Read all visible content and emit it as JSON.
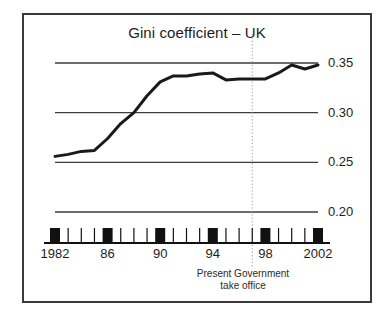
{
  "figure": {
    "title": "Gini coefficient – UK",
    "background_color": "#ffffff",
    "border_color": "#3a3a3a",
    "line_color": "#1a1a1a",
    "gridline_color": "#3d3d3d",
    "marker_color": "#111111",
    "annotation_line_color": "#9a9a9a"
  },
  "annotation": {
    "line1": "Present Government",
    "line2": "take office",
    "at_year": 1997
  },
  "chart_data": {
    "type": "line",
    "title": "Gini coefficient – UK",
    "xlabel": "",
    "ylabel": "",
    "xlim": [
      1982,
      2002
    ],
    "ylim": [
      0.2,
      0.355
    ],
    "grid": true,
    "gridlines_y": [
      0.2,
      0.25,
      0.3,
      0.35
    ],
    "legend": "none",
    "ytick_labels": [
      "0.35",
      "0.30",
      "0.25",
      "0.20"
    ],
    "ytick_values": [
      0.35,
      0.3,
      0.25,
      0.2
    ],
    "xtick_labels": [
      "1982",
      "86",
      "90",
      "94",
      "98",
      "2002"
    ],
    "xtick_values": [
      1982,
      1986,
      1990,
      1994,
      1998,
      2002
    ],
    "minor_xticks": [
      1983,
      1984,
      1985,
      1987,
      1988,
      1989,
      1991,
      1992,
      1993,
      1995,
      1996,
      1997,
      1999,
      2000,
      2001
    ],
    "x": [
      1982,
      1983,
      1984,
      1985,
      1986,
      1987,
      1988,
      1989,
      1990,
      1991,
      1992,
      1993,
      1994,
      1995,
      1996,
      1997,
      1998,
      1999,
      2000,
      2001,
      2002
    ],
    "series": [
      {
        "name": "Gini coefficient",
        "values": [
          0.256,
          0.258,
          0.261,
          0.262,
          0.274,
          0.289,
          0.3,
          0.317,
          0.331,
          0.337,
          0.337,
          0.339,
          0.34,
          0.333,
          0.334,
          0.334,
          0.334,
          0.34,
          0.348,
          0.344,
          0.348
        ]
      }
    ],
    "annotations": [
      {
        "type": "vline",
        "x": 1997,
        "style": "dotted",
        "label": "Present Government take office"
      }
    ]
  }
}
